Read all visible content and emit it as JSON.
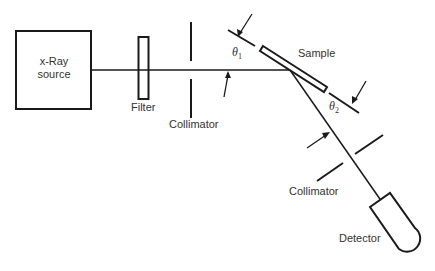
{
  "labels": {
    "source_line1": "x-Ray",
    "source_line2": "source",
    "filter": "Filter",
    "collimator1": "Collimator",
    "sample": "Sample",
    "collimator2": "Collimator",
    "detector": "Detector",
    "theta1": "θ",
    "theta1_sub": "1",
    "theta2": "θ",
    "theta2_sub": "2"
  },
  "colors": {
    "line": "#1a1a1a",
    "text": "#333333",
    "background": "#ffffff"
  }
}
